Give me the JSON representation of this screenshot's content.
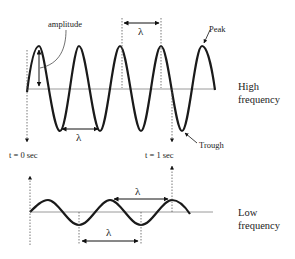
{
  "labels": {
    "amplitude": "amplitude",
    "peak": "Peak",
    "trough": "Trough",
    "t0": "t = 0 sec",
    "t1": "t = 1 sec",
    "wavelength_symbol": "λ",
    "high_frequency_line1": "High",
    "high_frequency_line2": "frequency",
    "low_frequency_line1": "Low",
    "low_frequency_line2": "frequency"
  },
  "waves": {
    "high_frequency": {
      "cycles_per_second": 4,
      "relative_amplitude": "large"
    },
    "low_frequency": {
      "cycles_per_second": 2.5,
      "relative_amplitude": "small"
    }
  },
  "colors": {
    "wave": "#1a1a1a",
    "axis": "#9a9a9a",
    "guide": "#555555",
    "text": "#222222"
  }
}
